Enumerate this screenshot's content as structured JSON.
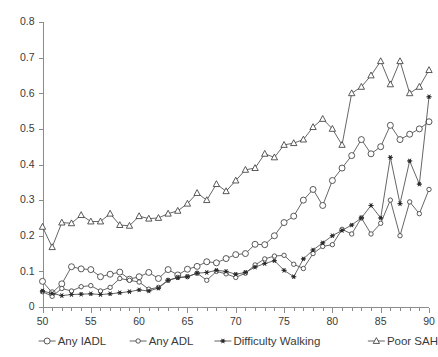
{
  "chart_data": {
    "type": "line",
    "title": "",
    "subtitle": "",
    "xlabel": "",
    "ylabel": "",
    "xlim": [
      50,
      90
    ],
    "ylim": [
      0,
      0.8
    ],
    "grid": false,
    "legend_position": "bottom",
    "y_ticks": [
      "0",
      "0.1",
      "0.2",
      "0.3",
      "0.4",
      "0.5",
      "0.6",
      "0.7",
      "0.8"
    ],
    "y_tick_values": [
      0,
      0.1,
      0.2,
      0.3,
      0.4,
      0.5,
      0.6,
      0.7,
      0.8
    ],
    "x_ticks": [
      "50",
      "55",
      "60",
      "65",
      "70",
      "75",
      "80",
      "85",
      "90"
    ],
    "x_tick_values": [
      50,
      55,
      60,
      65,
      70,
      75,
      80,
      85,
      90
    ],
    "x_minor_step": 1,
    "x": [
      50,
      51,
      52,
      53,
      54,
      55,
      56,
      57,
      58,
      59,
      60,
      61,
      62,
      63,
      64,
      65,
      66,
      67,
      68,
      69,
      70,
      71,
      72,
      73,
      74,
      75,
      76,
      77,
      78,
      79,
      80,
      81,
      82,
      83,
      84,
      85,
      86,
      87,
      88,
      89,
      90
    ],
    "series": [
      {
        "name": "Any IADL",
        "marker": "open-circle-large",
        "values": [
          0.072,
          0.04,
          0.065,
          0.113,
          0.107,
          0.105,
          0.085,
          0.092,
          0.098,
          0.078,
          0.085,
          0.097,
          0.08,
          0.105,
          0.09,
          0.106,
          0.114,
          0.127,
          0.124,
          0.136,
          0.147,
          0.15,
          0.176,
          0.175,
          0.2,
          0.237,
          0.255,
          0.3,
          0.33,
          0.285,
          0.355,
          0.39,
          0.425,
          0.47,
          0.43,
          0.45,
          0.51,
          0.47,
          0.485,
          0.5,
          0.52
        ]
      },
      {
        "name": "Any ADL",
        "marker": "open-circle-small",
        "values": [
          0.043,
          0.03,
          0.052,
          0.045,
          0.057,
          0.06,
          0.045,
          0.055,
          0.08,
          0.075,
          0.07,
          0.05,
          0.055,
          0.075,
          0.083,
          0.085,
          0.095,
          0.075,
          0.1,
          0.093,
          0.083,
          0.095,
          0.118,
          0.135,
          0.143,
          0.145,
          0.12,
          0.108,
          0.15,
          0.17,
          0.175,
          0.218,
          0.205,
          0.25,
          0.205,
          0.235,
          0.3,
          0.2,
          0.295,
          0.262,
          0.33
        ]
      },
      {
        "name": "Difficulty Walking",
        "marker": "filled-star",
        "values": [
          0.045,
          0.038,
          0.032,
          0.035,
          0.036,
          0.037,
          0.035,
          0.037,
          0.04,
          0.043,
          0.048,
          0.045,
          0.053,
          0.075,
          0.082,
          0.085,
          0.095,
          0.097,
          0.103,
          0.1,
          0.092,
          0.097,
          0.112,
          0.122,
          0.13,
          0.103,
          0.085,
          0.135,
          0.16,
          0.18,
          0.2,
          0.215,
          0.23,
          0.25,
          0.285,
          0.25,
          0.42,
          0.29,
          0.41,
          0.345,
          0.59
        ]
      },
      {
        "name": "Poor SAH",
        "marker": "open-triangle",
        "values": [
          0.225,
          0.168,
          0.237,
          0.235,
          0.258,
          0.24,
          0.24,
          0.262,
          0.23,
          0.228,
          0.255,
          0.248,
          0.25,
          0.262,
          0.27,
          0.29,
          0.32,
          0.3,
          0.345,
          0.325,
          0.355,
          0.385,
          0.39,
          0.43,
          0.42,
          0.455,
          0.46,
          0.47,
          0.505,
          0.528,
          0.5,
          0.455,
          0.6,
          0.618,
          0.65,
          0.69,
          0.625,
          0.69,
          0.6,
          0.618,
          0.665
        ]
      }
    ],
    "annotations": []
  },
  "legend": {
    "items": [
      {
        "label": "Any IADL",
        "marker": "open-circle-large"
      },
      {
        "label": "Any ADL",
        "marker": "open-circle-small"
      },
      {
        "label": "Difficulty Walking",
        "marker": "filled-star"
      },
      {
        "label": "Poor SAH",
        "marker": "open-triangle"
      }
    ]
  },
  "colors": {
    "axis": "#8c8c8c",
    "line": "#4a4a4a",
    "marker_stroke": "#3c3c3c",
    "marker_fill": "#ffffff",
    "star_fill": "#2a2a2a",
    "text": "#3a3a3a",
    "background": "#ffffff"
  }
}
